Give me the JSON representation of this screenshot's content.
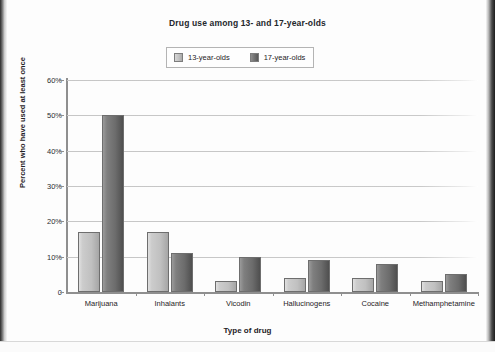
{
  "figure": {
    "title": "Drug use among 13- and 17-year-olds",
    "x_axis_title": "Type of drug",
    "y_axis_title": "Percent who have used at least once"
  },
  "legend": {
    "items": [
      {
        "label": "13-year-olds",
        "swatch": "light",
        "color": "#c2c2c2"
      },
      {
        "label": "17-year-olds",
        "swatch": "dark",
        "color": "#6f6f6f"
      }
    ]
  },
  "chart_data": {
    "type": "bar",
    "title": "Drug use among 13- and 17-year-olds",
    "xlabel": "Type of drug",
    "ylabel": "Percent who have used at least once",
    "categories": [
      "Marijuana",
      "Inhalants",
      "Vicodin",
      "Hallucinogens",
      "Cocaine",
      "Methamphetamine"
    ],
    "series": [
      {
        "name": "13-year-olds",
        "color": "#c2c2c2",
        "values": [
          17,
          17,
          3,
          4,
          4,
          3
        ]
      },
      {
        "name": "17-year-olds",
        "color": "#6f6f6f",
        "values": [
          50,
          11,
          10,
          9,
          8,
          5
        ]
      }
    ],
    "ylim": [
      0,
      60
    ],
    "yticks": [
      0,
      10,
      20,
      30,
      40,
      50,
      60
    ],
    "ytick_labels": [
      "0",
      "10%",
      "20%",
      "30%",
      "40%",
      "50%",
      "60%"
    ],
    "grid": true,
    "grid_axis": "y",
    "legend_position": "top-center"
  }
}
